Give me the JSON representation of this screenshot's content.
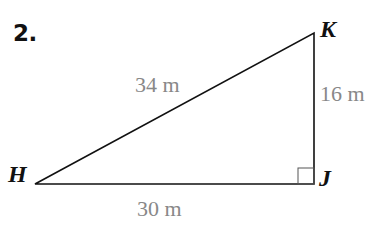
{
  "problem": {
    "number": "2."
  },
  "triangle": {
    "vertices": [
      {
        "label": "H",
        "x": 35,
        "y": 184
      },
      {
        "label": "J",
        "x": 314,
        "y": 184
      },
      {
        "label": "K",
        "x": 314,
        "y": 33
      }
    ],
    "sides": {
      "HK": "34 m",
      "KJ": "16 m",
      "HJ": "30 m"
    },
    "right_angle_at": "J",
    "line_color": "#111111",
    "label_color": "#888888"
  }
}
